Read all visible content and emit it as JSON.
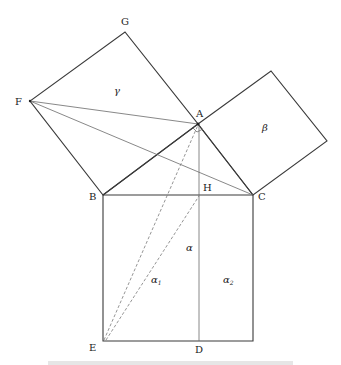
{
  "diagram": {
    "points": {
      "A": {
        "label": "A",
        "x": 198,
        "y": 124
      },
      "B": {
        "label": "B",
        "x": 103,
        "y": 195
      },
      "C": {
        "label": "C",
        "x": 253,
        "y": 195
      },
      "D": {
        "label": "D",
        "x": 199,
        "y": 341
      },
      "E": {
        "label": "E",
        "x": 103,
        "y": 341
      },
      "F": {
        "label": "F",
        "x": 30,
        "y": 101
      },
      "G": {
        "label": "G",
        "x": 125,
        "y": 32
      },
      "H": {
        "label": "H",
        "x": 199,
        "y": 195
      },
      "K": {
        "label": "",
        "x": 271,
        "y": 71
      },
      "L": {
        "label": "",
        "x": 327,
        "y": 141
      },
      "M": {
        "label": "",
        "x": 253,
        "y": 341
      }
    },
    "regions": {
      "gamma": {
        "label": "γ",
        "x": 117,
        "y": 93
      },
      "beta": {
        "label": "β",
        "x": 263,
        "y": 128
      },
      "alpha": {
        "label": "α",
        "x": 189,
        "y": 249
      },
      "alpha1": {
        "label": "α",
        "sub": "1",
        "x": 155,
        "y": 282
      },
      "alpha2": {
        "label": "α",
        "sub": "2",
        "x": 225,
        "y": 282
      }
    },
    "caption": "Fig. (caption text cut off at bottom of image)"
  }
}
